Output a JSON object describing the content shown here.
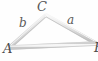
{
  "figure": {
    "kind": "geometry-diagram",
    "shape": "triangle",
    "background_color": "#fefefe",
    "stroke_color": "#d9d9d9",
    "stroke_highlight_color": "#f2f2f2",
    "stroke_shadow_color": "#bfbfbf",
    "label_color": "#4c4c4c",
    "vertices": [
      {
        "name": "A",
        "label": "A",
        "x": 10,
        "y": 47
      },
      {
        "name": "B",
        "label": "B",
        "x": 96,
        "y": 43
      },
      {
        "name": "C",
        "label": "C",
        "x": 46,
        "y": 15
      }
    ],
    "sides": [
      {
        "name": "a",
        "label": "a",
        "from": "B",
        "to": "C"
      },
      {
        "name": "b",
        "label": "b",
        "from": "A",
        "to": "C"
      },
      {
        "name": "c",
        "label": "",
        "from": "A",
        "to": "B"
      }
    ],
    "labels": {
      "vertex_a": "A",
      "vertex_b": "B",
      "vertex_c": "C",
      "side_a": "a",
      "side_b": "b"
    }
  }
}
